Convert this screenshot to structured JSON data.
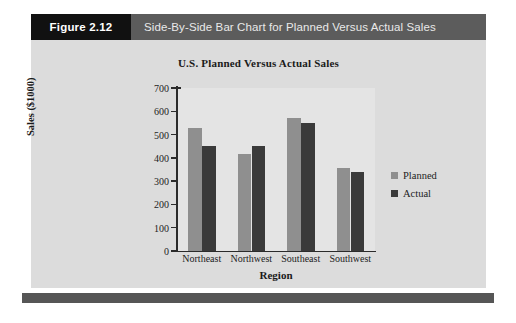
{
  "figure": {
    "tag": "Figure 2.12",
    "caption": "Side-By-Side Bar Chart for Planned Versus Actual Sales",
    "tag_bg": "#111111",
    "caption_bg": "#5c5c5c",
    "panel_bg": "#dcdcdc",
    "footer_bg": "#565656"
  },
  "legend": {
    "position": "right",
    "items": [
      {
        "label": "Planned",
        "color": "#8f8f8f"
      },
      {
        "label": "Actual",
        "color": "#3a3a3a"
      }
    ]
  },
  "chart_data": {
    "type": "bar",
    "title": "U.S. Planned Versus Actual Sales",
    "xlabel": "Region",
    "ylabel": "Sales ($1000)",
    "categories": [
      "Northeast",
      "Northwest",
      "Southeast",
      "Southwest"
    ],
    "series": [
      {
        "name": "Planned",
        "color": "#8f8f8f",
        "values": [
          530,
          415,
          570,
          355
        ]
      },
      {
        "name": "Actual",
        "color": "#3a3a3a",
        "values": [
          450,
          450,
          548,
          340
        ]
      }
    ],
    "ylim": [
      0,
      700
    ],
    "ytick_step": 100,
    "yticks": [
      0,
      100,
      200,
      300,
      400,
      500,
      600,
      700
    ],
    "ytick_labels": [
      "0",
      "100",
      "200",
      "300",
      "400",
      "500",
      "600",
      "700"
    ],
    "grid": false,
    "legend_position": "right"
  }
}
